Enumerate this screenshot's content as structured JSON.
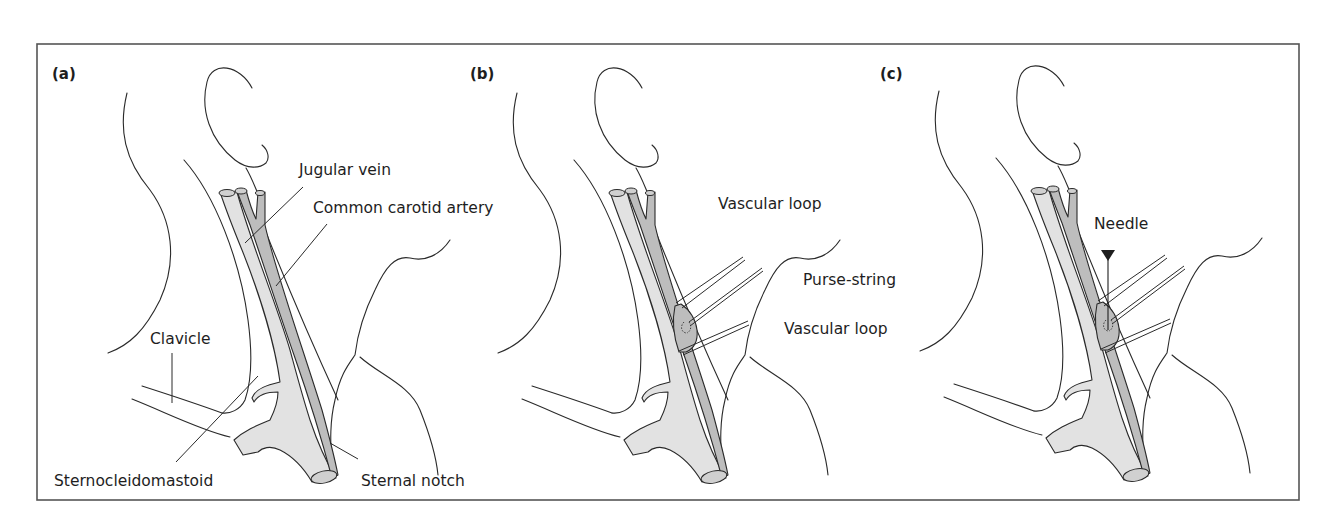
{
  "figure": {
    "panels": [
      {
        "id": "a",
        "label": "(a)",
        "annotations": {
          "jugular_vein": "Jugular vein",
          "common_carotid_artery": "Common carotid artery",
          "clavicle": "Clavicle",
          "sternocleidomastoid": "Sternocleidomastoid",
          "sternal_notch": "Sternal notch"
        }
      },
      {
        "id": "b",
        "label": "(b)",
        "annotations": {
          "vascular_loop_upper": "Vascular loop",
          "purse_string": "Purse-string",
          "vascular_loop_lower": "Vascular loop"
        }
      },
      {
        "id": "c",
        "label": "(c)",
        "annotations": {
          "needle": "Needle"
        }
      }
    ],
    "colors": {
      "vein_fill": "#e2e2e2",
      "artery_fill": "#bdbdbd",
      "outline": "#2a2a2a",
      "frame": "#555555",
      "background": "#ffffff"
    }
  }
}
